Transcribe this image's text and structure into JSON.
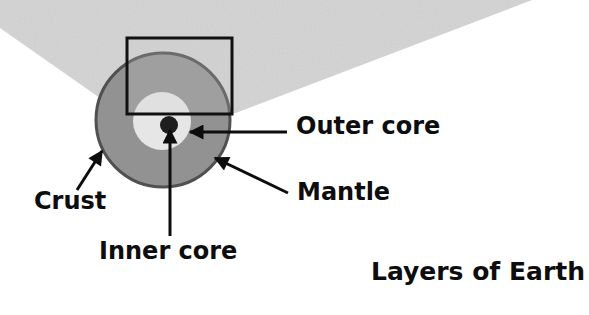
{
  "diagram": {
    "title": "Layers of Earth",
    "labels": {
      "outer_core": "Outer core",
      "mantle": "Mantle",
      "crust": "Crust",
      "inner_core": "Inner core"
    },
    "colors": {
      "wedge": "#d4d4d4",
      "mantle": "#929292",
      "crust_outline": "#505050",
      "outer_core": "#e6e6e6",
      "inner_core": "#1e1e1e",
      "frame": "#111111",
      "arrows": "#0d0d0d"
    }
  }
}
